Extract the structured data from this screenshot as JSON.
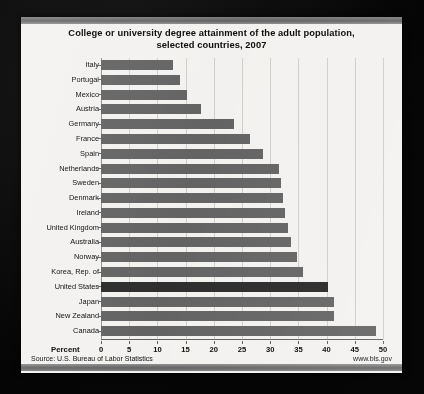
{
  "chart_data": {
    "type": "bar",
    "orientation": "horizontal",
    "title": "College or university degree attainment of the adult population, selected countries, 2007",
    "title_line1": "College or university degree attainment of the adult population,",
    "title_line2": "selected countries, 2007",
    "xlabel": "Percent",
    "ylabel": "",
    "xlim": [
      0,
      50
    ],
    "xticks": [
      0,
      5,
      10,
      15,
      20,
      25,
      30,
      35,
      40,
      45,
      50
    ],
    "grid": "vertical",
    "legend": "none",
    "categories": [
      "Italy",
      "Portugal",
      "Mexico",
      "Austria",
      "Germany",
      "France",
      "Spain",
      "Netherlands",
      "Sweden",
      "Denmark",
      "Ireland",
      "United Kingdom",
      "Australia",
      "Norway",
      "Korea, Rep. of",
      "United States",
      "Japan",
      "New Zealand",
      "Canada"
    ],
    "values": [
      12.8,
      14.0,
      15.2,
      17.7,
      23.6,
      26.4,
      28.7,
      31.5,
      31.9,
      32.3,
      32.7,
      33.1,
      33.7,
      34.8,
      35.8,
      40.2,
      41.4,
      41.4,
      48.8
    ],
    "highlight_category": "United States",
    "bar_color": "#6e6e6e",
    "highlight_color": "#333333"
  },
  "footer": {
    "source": "Source: U.S. Bureau of Labor Statistics",
    "website": "www.bls.gov"
  }
}
